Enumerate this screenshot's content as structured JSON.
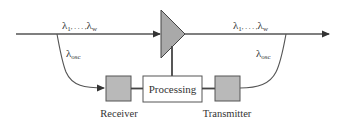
{
  "diagram": {
    "colors": {
      "line": "#555555",
      "amplifier_fill": "#a9a9a9",
      "module_fill": "#b9b9b9",
      "text": "#333333"
    },
    "amplifier": {
      "shape": "triangle",
      "name": "amplifier"
    },
    "signals": {
      "input": {
        "symbol": "λ",
        "sub_first": "1",
        "dots": ", . . . ,",
        "sub_last": "w"
      },
      "output": {
        "symbol": "λ",
        "sub_first": "1",
        "dots": ", . . . ,",
        "sub_last": "w"
      },
      "osc_drop": {
        "symbol": "λ",
        "sub": "osc"
      },
      "osc_add": {
        "symbol": "λ",
        "sub": "osc"
      }
    },
    "blocks": {
      "processing": "Processing",
      "receiver": "Receiver",
      "transmitter": "Transmitter"
    }
  }
}
